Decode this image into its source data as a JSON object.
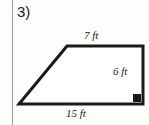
{
  "worksheet": {
    "problem_number": "3)",
    "margin_rule_color": "#9a9a9a",
    "background_color": "#fdfdfc"
  },
  "figure": {
    "shape_name": "trapezoid",
    "stroke_color": "#1a1a1a",
    "fill_color": "#ffffff",
    "right_angle_marker": {
      "present": true,
      "location": "bottom-right",
      "style": "filled-square",
      "color": "#1a1a1a"
    },
    "vertices": {
      "top_left": [
        67,
        46
      ],
      "top_right": [
        143,
        46
      ],
      "bottom_right": [
        143,
        104
      ],
      "bottom_left": [
        19,
        104
      ]
    },
    "labels": {
      "top": "7 ft",
      "right": "6 ft",
      "bottom": "15 ft"
    },
    "measurements": [
      {
        "side": "top",
        "value": 7,
        "unit": "ft",
        "text": "7 ft"
      },
      {
        "side": "right",
        "value": 6,
        "unit": "ft",
        "text": "6 ft"
      },
      {
        "side": "bottom",
        "value": 15,
        "unit": "ft",
        "text": "15 ft"
      }
    ]
  }
}
